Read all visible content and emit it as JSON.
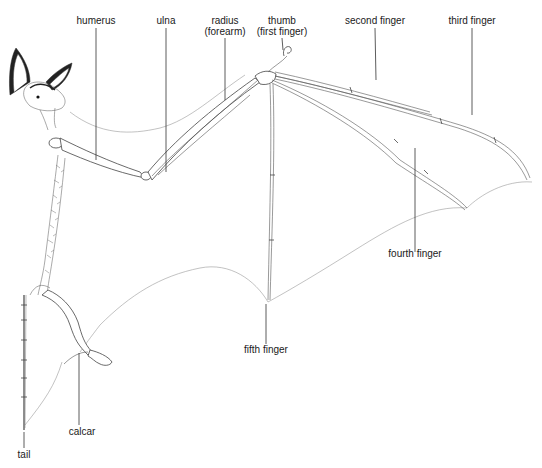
{
  "labels": {
    "humerus": "humerus",
    "ulna": "ulna",
    "radius_line1": "radius",
    "radius_line2": "(forearm)",
    "thumb_line1": "thumb",
    "thumb_line2": "(first finger)",
    "second_finger": "second finger",
    "third_finger": "third finger",
    "fourth_finger": "fourth finger",
    "fifth_finger": "fifth finger",
    "calcar": "calcar",
    "tail": "tail"
  },
  "colors": {
    "ink": "#1a1a1a",
    "membrane": "#999999",
    "background": "#ffffff"
  }
}
